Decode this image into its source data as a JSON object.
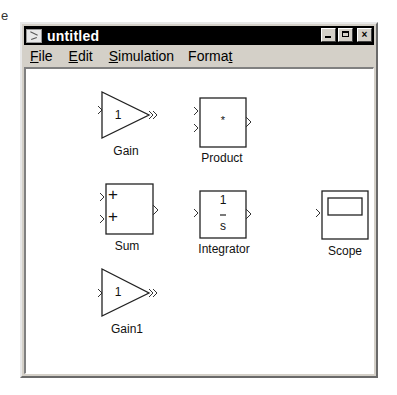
{
  "background_fragment": "e",
  "window": {
    "title": "untitled",
    "controls": {
      "minimize": "minimize",
      "maximize": "maximize",
      "close": "×"
    }
  },
  "menu": [
    {
      "label": "File",
      "mnemonic": "F"
    },
    {
      "label": "Edit",
      "mnemonic": "E"
    },
    {
      "label": "Simulation",
      "mnemonic": "S"
    },
    {
      "label": "Format",
      "mnemonic": "t"
    }
  ],
  "blocks": {
    "gain": {
      "label": "Gain",
      "value": "1"
    },
    "product": {
      "label": "Product",
      "symbol": "*"
    },
    "sum": {
      "label": "Sum",
      "signs": [
        "+",
        "+"
      ]
    },
    "integrator": {
      "label": "Integrator",
      "numerator": "1",
      "denominator": "s"
    },
    "scope": {
      "label": "Scope"
    },
    "gain1": {
      "label": "Gain1",
      "value": "1"
    }
  }
}
